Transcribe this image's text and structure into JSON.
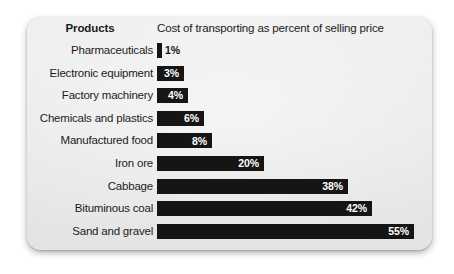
{
  "card": {
    "background_color": "#ebebeb",
    "bar_color": "#151515"
  },
  "header": {
    "products_label": "Products",
    "value_title": "Cost of transporting as percent of selling price"
  },
  "chart_data": {
    "type": "bar",
    "orientation": "horizontal",
    "title": "Cost of transporting as percent of selling price",
    "xlabel": "Cost of transporting as percent of selling price",
    "ylabel": "Products",
    "grid": false,
    "legend": null,
    "xlim": [
      0,
      55
    ],
    "value_suffix": "%",
    "categories": [
      "Pharmaceuticals",
      "Electronic equipment",
      "Factory machinery",
      "Chemicals and plastics",
      "Manufactured food",
      "Iron ore",
      "Cabbage",
      "Bituminous coal",
      "Sand and gravel"
    ],
    "values": [
      1,
      3,
      4,
      6,
      8,
      20,
      38,
      42,
      55
    ],
    "labels": [
      "1%",
      "3%",
      "4%",
      "6%",
      "8%",
      "20%",
      "38%",
      "42%",
      "55%"
    ],
    "rows": [
      {
        "category": "Pharmaceuticals",
        "value": 1,
        "label": "1%",
        "bar_px": 5,
        "label_inside": false
      },
      {
        "category": "Electronic equipment",
        "value": 3,
        "label": "3%",
        "bar_px": 27,
        "label_inside": true
      },
      {
        "category": "Factory machinery",
        "value": 4,
        "label": "4%",
        "bar_px": 31,
        "label_inside": true
      },
      {
        "category": "Chemicals and plastics",
        "value": 6,
        "label": "6%",
        "bar_px": 47,
        "label_inside": true
      },
      {
        "category": "Manufactured food",
        "value": 8,
        "label": "8%",
        "bar_px": 55,
        "label_inside": true
      },
      {
        "category": "Iron ore",
        "value": 20,
        "label": "20%",
        "bar_px": 107,
        "label_inside": true
      },
      {
        "category": "Cabbage",
        "value": 38,
        "label": "38%",
        "bar_px": 191,
        "label_inside": true
      },
      {
        "category": "Bituminous coal",
        "value": 42,
        "label": "42%",
        "bar_px": 215,
        "label_inside": true
      },
      {
        "category": "Sand and gravel",
        "value": 55,
        "label": "55%",
        "bar_px": 257,
        "label_inside": true
      }
    ]
  }
}
